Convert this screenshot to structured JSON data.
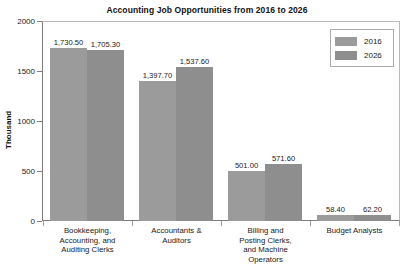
{
  "chart_data": {
    "type": "bar",
    "title": "Accounting Job Opportunities from 2016 to 2026",
    "xlabel": "",
    "ylabel": "Thousand",
    "ylim": [
      0,
      2000
    ],
    "yticks": [
      "0",
      "500",
      "1000",
      "1500",
      "2000"
    ],
    "grid": false,
    "legend_position": "top-right",
    "categories": [
      "Bookkeeping, Accounting, and Auditing Clerks",
      "Accountants & Auditors",
      "Billing and Posting Clerks, and Machine Operators",
      "Budget Analysts"
    ],
    "category_lines": [
      [
        "Bookkeeping,",
        "Accounting, and",
        "Auditing Clerks"
      ],
      [
        "Accountants &",
        "Auditors"
      ],
      [
        "Billing and",
        "Posting Clerks,",
        "and Machine",
        "Operators"
      ],
      [
        "Budget Analysts"
      ]
    ],
    "series": [
      {
        "name": "2016",
        "color": "#9b9b9b",
        "values": [
          1730.5,
          1397.7,
          501.0,
          58.4
        ],
        "labels": [
          "1,730.50",
          "1,397.70",
          "501.00",
          "58.40"
        ]
      },
      {
        "name": "2026",
        "color": "#8e8e8e",
        "values": [
          1705.3,
          1537.6,
          571.6,
          62.2
        ],
        "labels": [
          "1,705.30",
          "1,537.60",
          "571.60",
          "62.20"
        ]
      }
    ]
  },
  "legend": {
    "items": [
      {
        "label": "2016",
        "color": "#9b9b9b"
      },
      {
        "label": "2026",
        "color": "#8e8e8e"
      }
    ]
  }
}
